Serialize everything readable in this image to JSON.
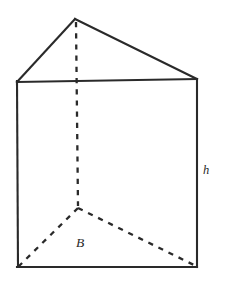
{
  "figure": {
    "name": "triangular-prism",
    "background_color": "#ffffff",
    "line_color": "#2a2a2a",
    "labels": {
      "base": {
        "text": "B",
        "meaning": "area of the triangular base",
        "x": 80,
        "y": 247,
        "style": "italic"
      },
      "height": {
        "text": "h",
        "meaning": "height of the prism",
        "x": 203,
        "y": 174,
        "style": "italic"
      }
    },
    "vertices": {
      "top_apex_rear": [
        75,
        19
      ],
      "top_front_left": [
        17,
        82
      ],
      "top_front_right": [
        197,
        79
      ],
      "bottom_apex_rear": [
        78,
        208
      ],
      "bottom_front_left": [
        18,
        267
      ],
      "bottom_front_right": [
        197,
        267
      ]
    },
    "edges_solid": [
      {
        "name": "top-left-slant",
        "from": [
          75,
          19
        ],
        "to": [
          17,
          82
        ]
      },
      {
        "name": "top-right-slant",
        "from": [
          75,
          19
        ],
        "to": [
          197,
          79
        ]
      },
      {
        "name": "top-front-horizontal",
        "from": [
          17,
          82
        ],
        "to": [
          197,
          79
        ]
      },
      {
        "name": "left-vertical",
        "from": [
          17,
          82
        ],
        "to": [
          18,
          267
        ]
      },
      {
        "name": "right-vertical",
        "from": [
          197,
          79
        ],
        "to": [
          197,
          267
        ]
      },
      {
        "name": "bottom-front-horizontal",
        "from": [
          18,
          267
        ],
        "to": [
          197,
          267
        ]
      }
    ],
    "edges_hidden": [
      {
        "name": "rear-vertical",
        "from": [
          76,
          22
        ],
        "to": [
          78,
          206
        ]
      },
      {
        "name": "base-left-diagonal",
        "from": [
          78,
          208
        ],
        "to": [
          19,
          266
        ]
      },
      {
        "name": "base-right-diagonal",
        "from": [
          78,
          208
        ],
        "to": [
          196,
          266
        ]
      }
    ]
  }
}
